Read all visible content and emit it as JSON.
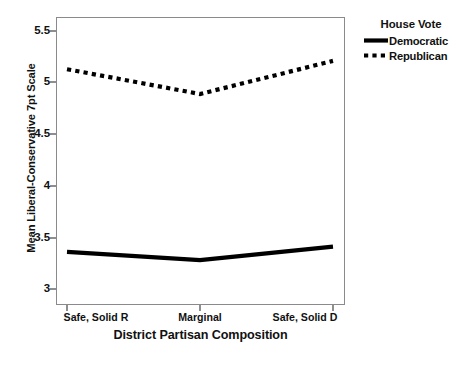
{
  "chart_data": {
    "type": "line",
    "title": "",
    "xlabel": "District Partisan Composition",
    "ylabel": "Mean Liberal-Conservative 7pt Scale",
    "categories": [
      "Safe, Solid R",
      "Marginal",
      "Safe, Solid D"
    ],
    "series": [
      {
        "name": "Democratic",
        "values": [
          3.36,
          3.28,
          3.41
        ],
        "style": "solid",
        "color": "#000000"
      },
      {
        "name": "Republican",
        "values": [
          5.13,
          4.89,
          5.21
        ],
        "style": "dotted",
        "color": "#000000"
      }
    ],
    "ylim": [
      2.85,
      5.62
    ],
    "yticks": [
      5.5,
      5,
      4.5,
      4,
      3.5,
      3
    ],
    "ytick_labels": [
      "5.5",
      "5",
      "4.5",
      "4",
      "3.5",
      "3"
    ],
    "xticks": [
      0,
      1,
      2
    ],
    "grid": false,
    "legend": {
      "title": "House Vote",
      "position": "right-top",
      "entries": [
        "Democratic",
        "Republican"
      ]
    }
  },
  "legend": {
    "title": "House Vote",
    "items": [
      {
        "label": "Democratic",
        "swatch": "solid-line-swatch"
      },
      {
        "label": "Republican",
        "swatch": "dotted-line-swatch"
      }
    ]
  },
  "axes": {
    "y_title": "Mean Liberal-Conservative 7pt Scale",
    "x_title": "District Partisan Composition",
    "y_tick_labels": [
      "5.5",
      "5",
      "4.5",
      "4",
      "3.5",
      "3"
    ],
    "x_tick_labels": [
      "Safe, Solid R",
      "Marginal",
      "Safe, Solid D"
    ]
  },
  "caption": {
    "text": ""
  },
  "colors": {
    "line": "#000000",
    "frame": "#8a8a8a",
    "background": "#ffffff"
  }
}
